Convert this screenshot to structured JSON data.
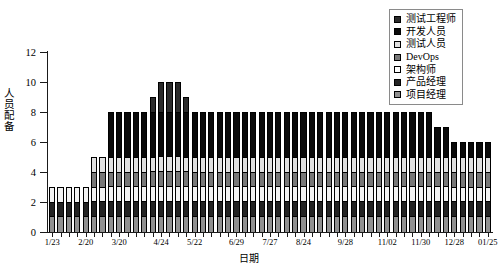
{
  "chart_data": {
    "type": "bar",
    "subtype": "stacked-bar",
    "title": "",
    "xlabel": "日期",
    "ylabel": "人员配备",
    "ylim": [
      0,
      12
    ],
    "y_ticks": [
      0,
      2,
      4,
      6,
      8,
      10,
      12
    ],
    "grid": false,
    "legend_position": "top-right",
    "x_tick_labels": [
      "1/23",
      "2/20",
      "3/20",
      "4/24",
      "5/22",
      "6/29",
      "7/27",
      "8/24",
      "9/28",
      "11/02",
      "11/30",
      "12/28",
      "01/25"
    ],
    "x_tick_indices": [
      0,
      4,
      8,
      13,
      17,
      22,
      26,
      30,
      35,
      40,
      44,
      48,
      52
    ],
    "categories": [
      "1/23",
      "1/30",
      "2/06",
      "2/13",
      "2/20",
      "2/27",
      "3/06",
      "3/13",
      "3/20",
      "3/27",
      "4/03",
      "4/10",
      "4/17",
      "4/24",
      "5/01",
      "5/08",
      "5/15",
      "5/22",
      "5/29",
      "6/05",
      "6/12",
      "6/19",
      "6/29",
      "7/06",
      "7/13",
      "7/20",
      "7/27",
      "8/03",
      "8/10",
      "8/17",
      "8/24",
      "8/31",
      "9/07",
      "9/14",
      "9/21",
      "9/28",
      "10/05",
      "10/12",
      "10/19",
      "10/26",
      "11/02",
      "11/09",
      "11/16",
      "11/23",
      "11/30",
      "12/07",
      "12/14",
      "12/21",
      "12/28",
      "01/04",
      "01/11",
      "01/18",
      "01/25"
    ],
    "totals": [
      3,
      3,
      3,
      3,
      3,
      5,
      5,
      8,
      8,
      8,
      8,
      8,
      9,
      10,
      10,
      10,
      9,
      8,
      8,
      8,
      8,
      8,
      8,
      8,
      8,
      8,
      8,
      8,
      8,
      8,
      8,
      8,
      8,
      8,
      8,
      8,
      8,
      8,
      8,
      8,
      8,
      8,
      8,
      8,
      8,
      8,
      7,
      7,
      6,
      6,
      6,
      6,
      6
    ],
    "series": [
      {
        "name": "项目经理",
        "color": "#909090",
        "values": [
          1,
          1,
          1,
          1,
          1,
          1,
          1,
          1,
          1,
          1,
          1,
          1,
          1,
          1,
          1,
          1,
          1,
          1,
          1,
          1,
          1,
          1,
          1,
          1,
          1,
          1,
          1,
          1,
          1,
          1,
          1,
          1,
          1,
          1,
          1,
          1,
          1,
          1,
          1,
          1,
          1,
          1,
          1,
          1,
          1,
          1,
          1,
          1,
          1,
          1,
          1,
          1,
          1
        ]
      },
      {
        "name": "产品经理",
        "color": "#232323",
        "values": [
          1,
          1,
          1,
          1,
          1,
          1,
          1,
          1,
          1,
          1,
          1,
          1,
          1,
          1,
          1,
          1,
          1,
          1,
          1,
          1,
          1,
          1,
          1,
          1,
          1,
          1,
          1,
          1,
          1,
          1,
          1,
          1,
          1,
          1,
          1,
          1,
          1,
          1,
          1,
          1,
          1,
          1,
          1,
          1,
          1,
          1,
          1,
          1,
          1,
          1,
          1,
          1,
          1
        ]
      },
      {
        "name": "架构师",
        "color": "#f2f2f2",
        "values": [
          1,
          1,
          1,
          1,
          1,
          1,
          1,
          1,
          1,
          1,
          1,
          1,
          1,
          1,
          1,
          1,
          1,
          1,
          1,
          1,
          1,
          1,
          1,
          1,
          1,
          1,
          1,
          1,
          1,
          1,
          1,
          1,
          1,
          1,
          1,
          1,
          1,
          1,
          1,
          1,
          1,
          1,
          1,
          1,
          1,
          1,
          1,
          1,
          1,
          1,
          1,
          1,
          1
        ]
      },
      {
        "name": "DevOps",
        "color": "#787878",
        "values": [
          0,
          0,
          0,
          0,
          0,
          1,
          1,
          1,
          1,
          1,
          1,
          1,
          1,
          1,
          1,
          1,
          1,
          1,
          1,
          1,
          1,
          1,
          1,
          1,
          1,
          1,
          1,
          1,
          1,
          1,
          1,
          1,
          1,
          1,
          1,
          1,
          1,
          1,
          1,
          1,
          1,
          1,
          1,
          1,
          1,
          1,
          1,
          1,
          1,
          1,
          1,
          1,
          1
        ]
      },
      {
        "name": "测试人员",
        "color": "#e0e0e0",
        "values": [
          0,
          0,
          0,
          0,
          0,
          1,
          1,
          1,
          1,
          1,
          1,
          1,
          1,
          1,
          1,
          1,
          1,
          1,
          1,
          1,
          1,
          1,
          1,
          1,
          1,
          1,
          1,
          1,
          1,
          1,
          1,
          1,
          1,
          1,
          1,
          1,
          1,
          1,
          1,
          1,
          1,
          1,
          1,
          1,
          1,
          1,
          1,
          1,
          1,
          1,
          1,
          1,
          1
        ]
      },
      {
        "name": "开发人员",
        "color": "#0a0a0a",
        "values": [
          0,
          0,
          0,
          0,
          0,
          0,
          0,
          3,
          3,
          3,
          3,
          3,
          3,
          3,
          3,
          3,
          3,
          3,
          3,
          3,
          3,
          3,
          3,
          3,
          3,
          3,
          3,
          3,
          3,
          3,
          3,
          3,
          3,
          3,
          3,
          3,
          3,
          3,
          3,
          3,
          3,
          3,
          3,
          3,
          3,
          3,
          2,
          2,
          1,
          1,
          1,
          1,
          1
        ]
      },
      {
        "name": "测试工程师",
        "color": "#2b2b2b",
        "values": [
          0,
          0,
          0,
          0,
          0,
          0,
          0,
          0,
          0,
          0,
          0,
          0,
          1,
          2,
          2,
          2,
          1,
          0,
          0,
          0,
          0,
          0,
          0,
          0,
          0,
          0,
          0,
          0,
          0,
          0,
          0,
          0,
          0,
          0,
          0,
          0,
          0,
          0,
          0,
          0,
          0,
          0,
          0,
          0,
          0,
          0,
          0,
          0,
          0,
          0,
          0,
          0,
          0
        ]
      }
    ]
  },
  "legend": {
    "items": [
      {
        "label": "测试工程师",
        "color": "#2b2b2b"
      },
      {
        "label": "开发人员",
        "color": "#0a0a0a"
      },
      {
        "label": "测试人员",
        "color": "#e0e0e0"
      },
      {
        "label": "DevOps",
        "color": "#787878"
      },
      {
        "label": "架构师",
        "color": "#ffffff"
      },
      {
        "label": "产品经理",
        "color": "#232323"
      },
      {
        "label": "项目经理",
        "color": "#909090"
      }
    ]
  }
}
